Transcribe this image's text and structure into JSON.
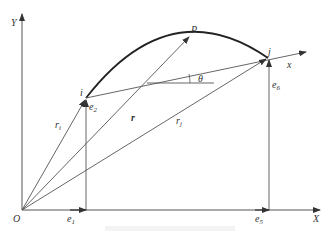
{
  "diagram": {
    "axes": {
      "Y": "Y",
      "X": "X",
      "origin": "O"
    },
    "points": {
      "i": "i",
      "j": "j",
      "P": "P"
    },
    "local_axis": "x",
    "angle": "θ",
    "vectors": {
      "r": "r",
      "r_i": "r",
      "i_sub": "i",
      "r_j": "r",
      "j_sub": "j"
    },
    "dofs": {
      "e1": {
        "base": "e",
        "sub": "1"
      },
      "e2": {
        "base": "e",
        "sub": "2"
      },
      "e5": {
        "base": "e",
        "sub": "5"
      },
      "e6": {
        "base": "e",
        "sub": "6"
      }
    },
    "colors": {
      "line": "#555555",
      "curve": "#222222",
      "text": "#333333"
    }
  }
}
